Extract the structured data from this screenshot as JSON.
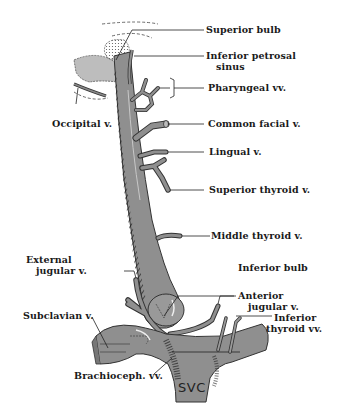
{
  "figure": {
    "colors": {
      "vein_fill": "#8f8f8f",
      "vein_light": "#a9a9a9",
      "vein_outline": "#333333",
      "hatch": "#2a2a2a",
      "sinus_fill": "#bdbdbd",
      "leader_line": "#222222",
      "text": "#1a1a1a",
      "background": "#ffffff"
    }
  },
  "labels": {
    "superior_bulb": "Superior bulb",
    "inferior_petrosal_1": "Inferior petrosal",
    "inferior_petrosal_2": "sinus",
    "pharyngeal": "Pharyngeal vv.",
    "occipital": "Occipital v.",
    "common_facial": "Common facial v.",
    "lingual": "Lingual v.",
    "superior_thyroid": "Superior thyroid v.",
    "middle_thyroid": "Middle thyroid v.",
    "external_jugular_1": "External",
    "external_jugular_2": "jugular v.",
    "inferior_bulb": "Inferior bulb",
    "anterior_jugular_1": "Anterior",
    "anterior_jugular_2": "jugular v.",
    "subclavian": "Subclavian v.",
    "inferior_thyroid_1": "Inferior",
    "inferior_thyroid_2": "thyroid vv.",
    "brachioceph": "Brachioceph. vv.",
    "svc": "SVC"
  }
}
